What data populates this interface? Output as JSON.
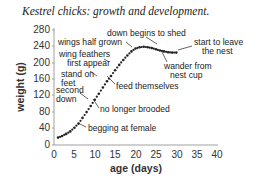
{
  "chart_data": {
    "type": "line",
    "title": "Kestrel chicks: growth and development.",
    "xlabel": "age (days)",
    "ylabel": "weight (g)",
    "xlim": [
      0,
      40
    ],
    "ylim": [
      0,
      280
    ],
    "xticks": [
      0,
      5,
      10,
      15,
      20,
      25,
      30,
      35,
      40
    ],
    "yticks": [
      0,
      40,
      80,
      120,
      160,
      200,
      240,
      280
    ],
    "grid": false,
    "legend": null,
    "series": [
      {
        "name": "weight",
        "style": "dotted",
        "x": [
          1,
          2,
          3,
          4,
          5,
          6,
          7,
          8,
          9,
          10,
          11,
          12,
          13,
          14,
          15,
          16,
          17,
          18,
          19,
          20,
          21,
          22,
          23,
          24,
          25,
          26,
          27,
          28,
          29,
          30
        ],
        "y": [
          18,
          22,
          27,
          33,
          42,
          52,
          66,
          80,
          95,
          110,
          125,
          140,
          155,
          168,
          182,
          195,
          207,
          218,
          228,
          235,
          238,
          239,
          238,
          236,
          233,
          230,
          228,
          226,
          225,
          225
        ]
      }
    ],
    "annotations": [
      {
        "text": "begging at female",
        "x": 6,
        "y": 52
      },
      {
        "text": "no longer brooded",
        "x": 10,
        "y": 110
      },
      {
        "text": "second down",
        "x": 9,
        "y": 128
      },
      {
        "text": "stand on feet",
        "x": 12,
        "y": 150
      },
      {
        "text": "feed themselves",
        "x": 13,
        "y": 163
      },
      {
        "text": "wing feathers first appear",
        "x": 15,
        "y": 182
      },
      {
        "text": "wings half grown",
        "x": 19,
        "y": 226
      },
      {
        "text": "down begins to shed",
        "x": 22,
        "y": 239
      },
      {
        "text": "wander from nest cup",
        "x": 24,
        "y": 235
      },
      {
        "text": "start to leave the nest",
        "x": 30,
        "y": 225
      }
    ]
  },
  "labels": {
    "title": "Kestrel chicks: growth and development.",
    "xlabel": "age (days)",
    "ylabel": "weight (g)",
    "ann_begging": "begging at female",
    "ann_brooded": "no longer brooded",
    "ann_second_1": "second",
    "ann_second_2": "down",
    "ann_stand_1": "stand on",
    "ann_stand_2": "feet",
    "ann_feed": "feed themselves",
    "ann_wingfeat_1": "wing feathers",
    "ann_wingfeat_2": "first appear",
    "ann_wingshalf": "wings half grown",
    "ann_down": "down begins to shed",
    "ann_wander_1": "wander from",
    "ann_wander_2": "nest cup",
    "ann_leave_1": "start to leave",
    "ann_leave_2": "the nest",
    "xt0": "0",
    "xt5": "5",
    "xt10": "10",
    "xt15": "15",
    "xt20": "20",
    "xt25": "25",
    "xt30": "30",
    "xt35": "35",
    "xt40": "40",
    "yt0": "0",
    "yt40": "40",
    "yt80": "80",
    "yt120": "120",
    "yt160": "160",
    "yt200": "200",
    "yt240": "240",
    "yt280": "280"
  }
}
